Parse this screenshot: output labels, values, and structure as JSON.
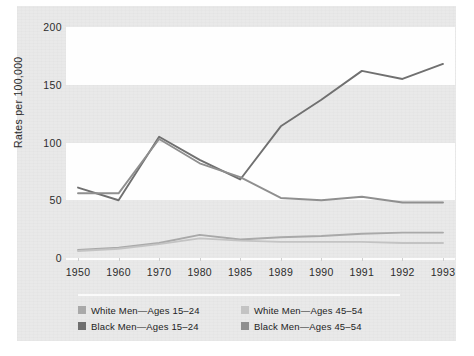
{
  "figure": {
    "y_axis_title": "Rates per 100,000",
    "panel_color": "#e9e9e9",
    "band_light_color": "#fefefe"
  },
  "legend": {
    "items": [
      {
        "label": "White Men—Ages 15–24",
        "color": "#a9a9a9",
        "key": "white_15_24"
      },
      {
        "label": "White Men—Ages 45–54",
        "color": "#c3c3c3",
        "key": "white_45_54"
      },
      {
        "label": "Black Men—Ages 15–24",
        "color": "#707070",
        "key": "black_15_24"
      },
      {
        "label": "Black Men—Ages 45–54",
        "color": "#8f8f8f",
        "key": "black_45_54"
      }
    ]
  },
  "chart_data": {
    "type": "line",
    "title": "",
    "xlabel": "",
    "ylabel": "Rates per 100,000",
    "categories": [
      "1950",
      "1960",
      "1970",
      "1980",
      "1985",
      "1989",
      "1990",
      "1991",
      "1992",
      "1993"
    ],
    "x_tick_labels": [
      "1950",
      "1960",
      "1970",
      "1980",
      "1985",
      "1989",
      "1990",
      "1991",
      "1992",
      "1993"
    ],
    "y_tick_labels": [
      "0",
      "50",
      "100",
      "150",
      "200"
    ],
    "y_ticks": [
      0,
      50,
      100,
      150,
      200
    ],
    "ylim": [
      0,
      200
    ],
    "grid": false,
    "banded_background": true,
    "legend_position": "bottom",
    "series": [
      {
        "name": "Black Men—Ages 15–24",
        "color": "#707070",
        "values": [
          61,
          50,
          105,
          85,
          68,
          114,
          137,
          162,
          155,
          168
        ]
      },
      {
        "name": "Black Men—Ages 45–54",
        "color": "#8f8f8f",
        "values": [
          56,
          56,
          103,
          82,
          70,
          52,
          50,
          53,
          48,
          48
        ]
      },
      {
        "name": "White Men—Ages 15–24",
        "color": "#a9a9a9",
        "values": [
          7,
          9,
          13,
          20,
          16,
          18,
          19,
          21,
          22,
          22
        ]
      },
      {
        "name": "White Men—Ages 45–54",
        "color": "#c3c3c3",
        "values": [
          6,
          8,
          12,
          17,
          15,
          14,
          14,
          14,
          13,
          13
        ]
      }
    ]
  }
}
